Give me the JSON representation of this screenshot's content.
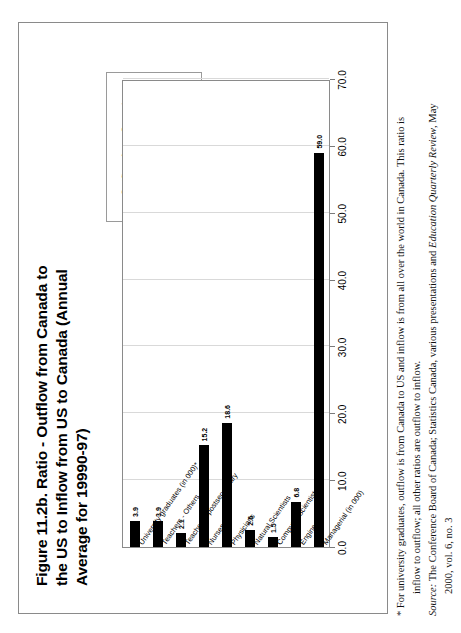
{
  "figure": {
    "title": "Figure 11.2b. Ratio - Outflow from Canada to the US to Inflow from US to Canada (Annual Average for 19990-97)",
    "border_color": "#8a8a8a"
  },
  "legend": {
    "swatch_color": "#000000",
    "entries": [
      {
        "label": "Outflow from Canada to US/Inflow from US to Canada"
      }
    ]
  },
  "footnote": {
    "marker": "*",
    "line1": "* For university graduates, outflow is from Canada to US and inflow is from all over the world in Canada. This ratio is",
    "line2": "inflow to outflow; all other ratios are outflow to inflow.",
    "source_label": "Source:",
    "source_text_a": " The Conference Board of Canada; Statistics Canada, various presentations and ",
    "source_italic": "Education Quarterly Review",
    "source_text_b": ", May",
    "source_line2": "2000, vol. 6, no. 3"
  },
  "chart_data": {
    "type": "bar",
    "orientation": "horizontal",
    "title": "Figure 11.2b. Ratio - Outflow from Canada to the US to Inflow from US to Canada (Annual Average for 19990-97)",
    "xlabel": "",
    "ylabel": "",
    "xlim": [
      0,
      70
    ],
    "ticks": [
      "0.0",
      "10.0",
      "20.0",
      "30.0",
      "40.0",
      "50.0",
      "60.0",
      "70.0"
    ],
    "tick_values": [
      0,
      10,
      20,
      30,
      40,
      50,
      60,
      70
    ],
    "grid": true,
    "legend_position": "top-right",
    "series_name": "Outflow from Canada to US/Inflow from US to Canada",
    "bar_color": "#000000",
    "categories": [
      "Managerial (in 000)",
      "Engineers",
      "Computer Scientists",
      "Natural Scientists",
      "Physicians",
      "Nurses",
      "Teachers - postsecondary",
      "Teachers - Others",
      "University graduates (in 000)*"
    ],
    "values": [
      59.0,
      6.8,
      1.5,
      2.6,
      18.6,
      15.2,
      2.1,
      3.9,
      3.9
    ],
    "labels": [
      "59.0",
      "6.8",
      "1.5",
      "2.6",
      "18.6",
      "15.2",
      "2.1",
      "3.9",
      "3.9"
    ]
  }
}
